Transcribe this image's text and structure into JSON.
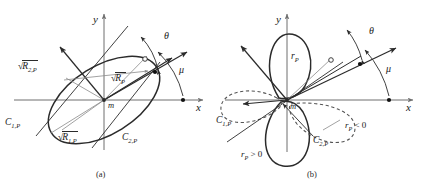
{
  "figure": {
    "type": "two-panel-vector-diagram",
    "panels": [
      {
        "id": "a",
        "caption": "(a)",
        "axes": {
          "x_label": "x",
          "y_label": "y",
          "origin_label": "m"
        },
        "shape": "ellipse",
        "labels": {
          "principal_axis_2": "R",
          "principal_axis_2_sub": "2,P",
          "radius_general": "R",
          "radius_general_sub": "P",
          "principal_axis_1": "R",
          "principal_axis_1_sub": "1,P",
          "curvature_1": "C",
          "curvature_1_sub": "1,P",
          "curvature_2": "C",
          "curvature_2_sub": "2,P",
          "angle_theta": "θ",
          "angle_mu": "μ"
        }
      },
      {
        "id": "b",
        "caption": "(b)",
        "axes": {
          "x_label": "x",
          "y_label": "y",
          "origin_label": "m"
        },
        "shape": "four-lobed-rosette",
        "labels": {
          "radius_general": "r",
          "radius_general_sub": "P",
          "curvature_1": "C",
          "curvature_1_sub": "1,P",
          "curvature_2": "C",
          "curvature_2_sub": "2,P",
          "angle_theta": "θ",
          "angle_mu": "μ",
          "positive_branch": "r",
          "positive_branch_sub": "P",
          "positive_branch_op": " > 0",
          "negative_branch": "r",
          "negative_branch_sub": "P",
          "negative_branch_op": " < 0"
        }
      }
    ],
    "colors": {
      "stroke": "#2b2b2b",
      "axis": "#6f6f6f",
      "thin": "#8a8a8a",
      "dashed": "#555555",
      "background": "#ffffff"
    }
  }
}
